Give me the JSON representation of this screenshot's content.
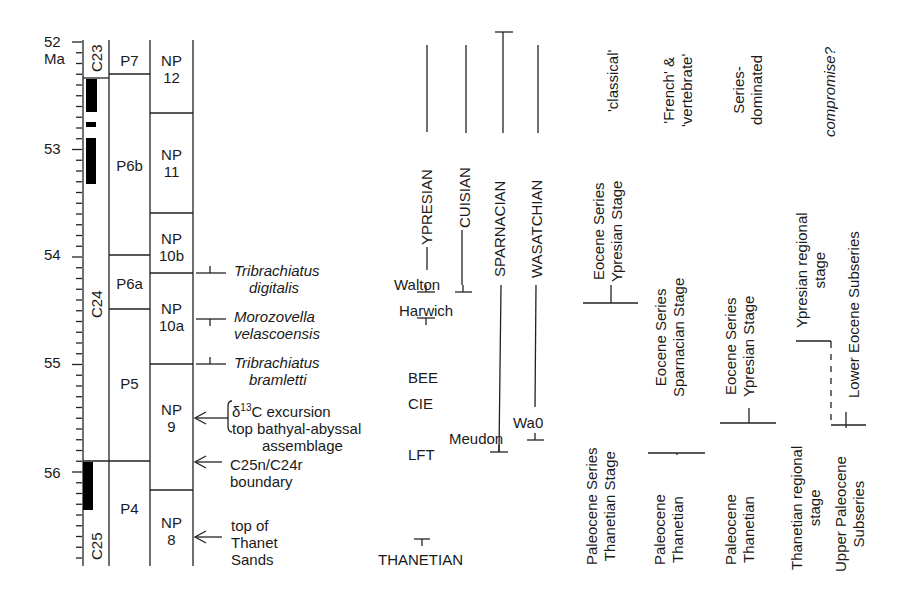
{
  "scale": {
    "unit": "Ma",
    "ticks": [
      "52",
      "53",
      "54",
      "55",
      "56"
    ]
  },
  "columns": {
    "polarity": {
      "chrons": [
        "C23",
        "C24",
        "C25"
      ]
    },
    "planktonic_foraminifera": {
      "zones": [
        "P7",
        "P6b",
        "P6a",
        "P5",
        "P4"
      ]
    },
    "nannofossils": {
      "zones": [
        {
          "line1": "NP",
          "line2": "12"
        },
        {
          "line1": "NP",
          "line2": "11"
        },
        {
          "line1": "NP",
          "line2": "10b"
        },
        {
          "line1": "NP",
          "line2": "10a"
        },
        {
          "line1": "NP",
          "line2": "9"
        },
        {
          "line1": "NP",
          "line2": "8"
        }
      ]
    }
  },
  "events": {
    "tribrachiatus_digitalis": {
      "line1": "Tribrachiatus",
      "line2": "digitalis"
    },
    "morozovella": {
      "line1": "Morozovella",
      "line2": "velascoensis"
    },
    "tribrachiatus_bramletti": {
      "line1": "Tribrachiatus",
      "line2": "bramletti"
    },
    "delta_prefix": "δ",
    "delta_sup": "13",
    "delta_rest": "C excursion",
    "bathyal": "top bathyal-abyssal",
    "assemblage": "assemblage",
    "c25n_line1": "C25n/C24r",
    "c25n_line2": "boundary",
    "thanet_line1": "top of",
    "thanet_line2": "Thanet",
    "thanet_line3": "Sands"
  },
  "stages": {
    "ypresian": "YPRESIAN",
    "cuisian": "CUISIAN",
    "sparnacian": "SPARNACIAN",
    "wasatchian": "WASATCHIAN",
    "thanetian": "THANETIAN",
    "walton": "Walton",
    "harwich": "Harwich",
    "bee": "BEE",
    "cie": "CIE",
    "lft": "LFT",
    "meudon": "Meudon",
    "wa0": "Wa0"
  },
  "schemes": [
    {
      "header": [
        "'classical'"
      ],
      "italic": false,
      "upper": [
        "Eocene Series",
        "Ypresian Stage"
      ],
      "lower": [
        "Paleocene Series",
        "Thanetian Stage"
      ]
    },
    {
      "header": [
        "'French' &",
        "'vertebrate'"
      ],
      "italic": false,
      "upper": [
        "Eocene   Series",
        "Sparnacian Stage"
      ],
      "lower": [
        "Paleocene",
        "Thanetian"
      ]
    },
    {
      "header": [
        "Series-",
        "dominated"
      ],
      "italic": false,
      "upper": [
        "Eocene   Series",
        "Ypresian Stage"
      ],
      "lower": [
        "Paleocene",
        "Thanetian"
      ]
    },
    {
      "header": [
        "compromise?"
      ],
      "italic": true,
      "upper_a": [
        "Ypresian regional",
        "stage"
      ],
      "upper_b": [
        "Lower Eocene Subseries"
      ],
      "lower_a": [
        "Thanetian regional",
        "stage"
      ],
      "lower_b": [
        "Upper Paleocene",
        "Subseries"
      ]
    }
  ]
}
